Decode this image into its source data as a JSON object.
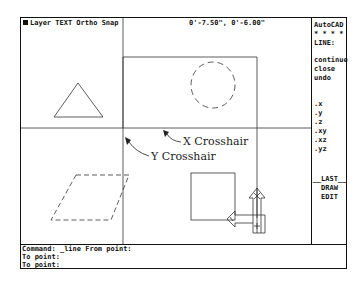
{
  "status_bar": {
    "layer_label": "Layer TEXT Ortho Snap",
    "coordinates": "0'-7.50\", 0'-6.00\""
  },
  "side_menu": {
    "title": "AutoCAD",
    "separator": "* * * *",
    "command": "LINE:",
    "options": [
      "continue",
      "close",
      "undo"
    ],
    "filters": [
      ".x",
      ".y",
      ".z",
      ".xy",
      ".xz",
      ".yz"
    ],
    "nav": [
      "__LAST__",
      "DRAW",
      "EDIT"
    ]
  },
  "command_area": {
    "lines": [
      "Command: _line From point:",
      "To point:",
      "To point:"
    ]
  },
  "annotations": {
    "x_crosshair": "X Crosshair",
    "y_crosshair": "Y Crosshair"
  },
  "drawing": {
    "objects": [
      "triangle",
      "dashed-circle",
      "dashed-parallelogram",
      "square",
      "large-rectangle",
      "ucs-icon"
    ],
    "crosshair": {
      "x": 122,
      "y": 127
    }
  }
}
